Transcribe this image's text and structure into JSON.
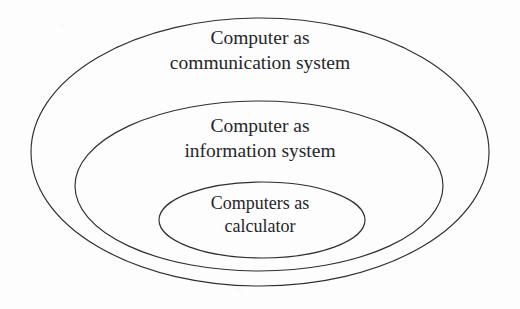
{
  "diagram": {
    "type": "nested-ellipses-venn",
    "title": "",
    "background_color": "#fdfdfd",
    "stroke_color": "#2e2e33",
    "text_color": "#26262b",
    "levels": [
      {
        "id": "outer",
        "name": "computer-as-communication-system",
        "line1": "Computer as",
        "line2": "communication system",
        "ellipse": {
          "cx": 260,
          "cy": 152,
          "rx": 229,
          "ry": 134
        }
      },
      {
        "id": "middle",
        "name": "computer-as-information-system",
        "line1": "Computer as",
        "line2": "information system",
        "ellipse": {
          "cx": 259,
          "cy": 186,
          "rx": 184,
          "ry": 85
        }
      },
      {
        "id": "inner",
        "name": "computers-as-calculator",
        "line1": "Computers as",
        "line2": "calculator",
        "ellipse": {
          "cx": 262,
          "cy": 220,
          "rx": 103,
          "ry": 38
        }
      }
    ]
  }
}
